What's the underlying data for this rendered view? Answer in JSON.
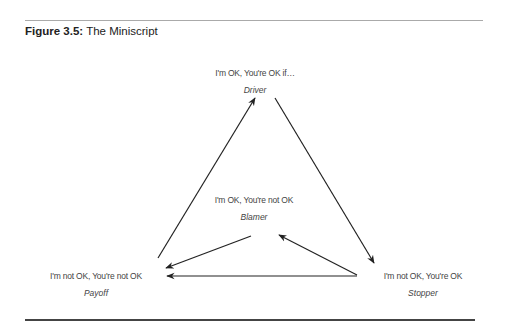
{
  "figure": {
    "label": "Figure 3.5:",
    "title": "The Miniscript"
  },
  "nodes": {
    "driver": {
      "state": "I'm OK, You're OK if…",
      "role": "Driver"
    },
    "blamer": {
      "state": "I'm OK, You're not OK",
      "role": "Blamer"
    },
    "payoff": {
      "state": "I'm not OK, You're not OK",
      "role": "Payoff"
    },
    "stopper": {
      "state": "I'm not OK, You're OK",
      "role": "Stopper"
    }
  },
  "edges": [
    {
      "from": "payoff",
      "to": "driver"
    },
    {
      "from": "driver",
      "to": "stopper"
    },
    {
      "from": "stopper",
      "to": "payoff"
    },
    {
      "from": "stopper",
      "to": "blamer"
    },
    {
      "from": "blamer",
      "to": "payoff"
    }
  ],
  "colors": {
    "line": "#222222",
    "text": "#444444",
    "rule_top": "#aaaaaa",
    "rule_bottom": "#444444"
  }
}
